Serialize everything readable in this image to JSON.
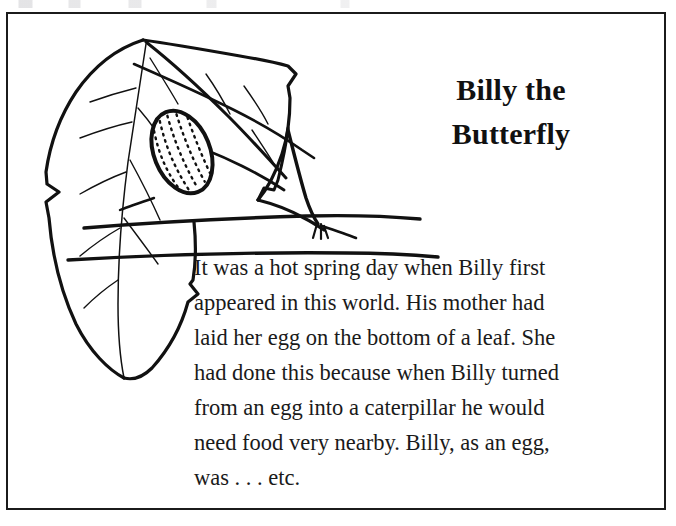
{
  "page": {
    "kind": "illustrated-story-page",
    "background_color": "#ffffff",
    "ink_color": "#111111",
    "frame": {
      "border_color": "#1b1b1b",
      "border_width_px": 2
    }
  },
  "title": {
    "full_text": "Billy the Butterfly",
    "lines": [
      "Billy the",
      "Butterfly"
    ]
  },
  "body": {
    "full_text": "It was a hot spring day when Billy first appeared in this world. His mother had laid her egg on the bottom of a leaf. She had done this because when Billy turned from an egg into a caterpillar he would need food very nearby. Billy, as an egg, was . . . etc.",
    "lines": [
      "It was a hot spring day when Billy first",
      "appeared in this world. His mother had",
      "laid her egg on the bottom of a leaf. She",
      "had done this because when Billy turned",
      "from an egg into a caterpillar he would",
      "need food very nearby. Billy, as an egg,",
      "was . . . etc."
    ]
  },
  "illustration": {
    "description": "Pen-and-ink line drawing of a large leaf hanging from a twig, with a butterfly egg attached to the underside of the leaf",
    "parts": [
      "leaf-blade",
      "leaf-midrib",
      "leaf-veins",
      "folded-leaf-tip",
      "butterfly-egg",
      "leaf-stem",
      "branch-line-upper",
      "branch-line-lower"
    ],
    "egg": {
      "shape": "oval",
      "texture": "dotted-ribs",
      "rib_count": 5
    }
  }
}
